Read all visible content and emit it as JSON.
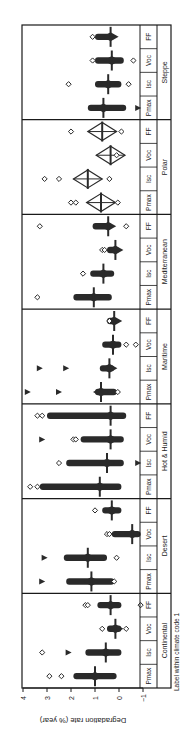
{
  "chart_data": {
    "type": "scatter",
    "subtype": "box-diamond-distribution",
    "orientation": "rotated-90-clockwise",
    "title": "",
    "ylabel": "Degradation rate (% year)",
    "xlabel": "Label within climate code 1",
    "ylim": [
      -1,
      4
    ],
    "yticks": [
      -1,
      0,
      1,
      2,
      3,
      4
    ],
    "grid": false,
    "legend": null,
    "parameters": [
      "Pmax",
      "Isc",
      "Voc",
      "FF"
    ],
    "groups": [
      {
        "name": "Continental",
        "median": {
          "Pmax": 1.0,
          "Isc": 0.55,
          "Voc": 0.15,
          "FF": 0.35
        },
        "range": {
          "Pmax": [
            0.1,
            1.9
          ],
          "Isc": [
            -0.1,
            1.4
          ],
          "Voc": [
            -0.1,
            0.5
          ],
          "FF": [
            -0.1,
            0.9
          ]
        },
        "outliers_open": {
          "Pmax": [
            2.9,
            2.4
          ],
          "Isc": [
            3.2
          ],
          "Voc": [
            0.7,
            -0.3
          ],
          "FF": [
            1.4,
            1.3,
            -0.9
          ]
        },
        "outliers_filled": {
          "Pmax": [],
          "Isc": [
            2.1
          ],
          "Voc": [],
          "FF": []
        }
      },
      {
        "name": "Desert",
        "median": {
          "Pmax": 1.15,
          "Isc": 1.3,
          "Voc": -0.55,
          "FF": 0.3
        },
        "range": {
          "Pmax": [
            0.2,
            2.2
          ],
          "Isc": [
            0.5,
            2.3
          ],
          "Voc": [
            -0.9,
            0.3
          ],
          "FF": [
            -0.1,
            0.7
          ]
        },
        "outliers_open": {
          "Pmax": [
            0.2
          ],
          "Isc": [
            0.1
          ],
          "Voc": [
            0.5,
            0.4
          ],
          "FF": [
            1.0
          ]
        },
        "outliers_filled": {
          "Pmax": [
            3.2
          ],
          "Isc": [
            3.1
          ],
          "Voc": [],
          "FF": []
        }
      },
      {
        "name": "Hot & Humid",
        "median": {
          "Pmax": 0.8,
          "Isc": 0.5,
          "Voc": 0.35,
          "FF": 0.35
        },
        "range": {
          "Pmax": [
            -0.1,
            3.3
          ],
          "Isc": [
            -0.2,
            2.2
          ],
          "Voc": [
            -0.2,
            1.6
          ],
          "FF": [
            -0.3,
            3.0
          ]
        },
        "outliers_open": {
          "Pmax": [
            3.7,
            3.4
          ],
          "Isc": [
            2.5
          ],
          "Voc": [
            1.9,
            1.8
          ],
          "FF": [
            3.4,
            3.2
          ]
        },
        "outliers_filled": {
          "Pmax": [],
          "Isc": [
            -0.8
          ],
          "Voc": [
            3.2
          ],
          "FF": []
        }
      },
      {
        "name": "Maritime",
        "median": {
          "Pmax": 0.75,
          "Isc": 0.4,
          "Voc": 0.25,
          "FF": 0.2
        },
        "range": {
          "Pmax": [
            0.1,
            1.0
          ],
          "Isc": [
            0.2,
            0.8
          ],
          "Voc": [
            -0.1,
            0.7
          ],
          "FF": [
            0.1,
            0.5
          ]
        },
        "outliers_open": {
          "Pmax": [
            0.05
          ],
          "Isc": [],
          "Voc": [
            -0.3,
            -0.7
          ],
          "FF": [
            0.4
          ]
        },
        "outliers_filled": {
          "Pmax": [
            3.8,
            2.5
          ],
          "Isc": [
            3.3,
            2.2
          ],
          "Voc": [],
          "FF": []
        }
      },
      {
        "name": "Mediterranean",
        "median": {
          "Pmax": 1.05,
          "Isc": 0.65,
          "Voc": 0.15,
          "FF": 0.45
        },
        "range": {
          "Pmax": [
            0.3,
            1.9
          ],
          "Isc": [
            0.2,
            1.2
          ],
          "Voc": [
            0.0,
            0.5
          ],
          "FF": [
            0.3,
            1.1
          ]
        },
        "outliers_open": {
          "Pmax": [
            3.4
          ],
          "Isc": [
            1.5
          ],
          "Voc": [
            0.7,
            0.6
          ],
          "FF": [
            3.3,
            -0.3
          ]
        },
        "outliers_filled": {
          "Pmax": [],
          "Isc": [],
          "Voc": [],
          "FF": []
        }
      },
      {
        "name": "Polar",
        "median": {
          "Pmax": 0.75,
          "Isc": 1.3,
          "Voc": 0.35,
          "FF": 0.7
        },
        "range": {
          "Pmax": [
            0.1,
            1.6
          ],
          "Isc": [
            0.5,
            2.1
          ],
          "Voc": [
            0.1,
            0.7
          ],
          "FF": [
            0.1,
            1.3
          ]
        },
        "outliers_open": {
          "Pmax": [
            2.0,
            1.8,
            0.05
          ],
          "Isc": [
            3.1,
            2.5,
            0.4
          ],
          "Voc": [
            0.1
          ],
          "FF": [
            2.0,
            -0.1
          ]
        },
        "outliers_filled": {
          "Pmax": [],
          "Isc": [],
          "Voc": [],
          "FF": []
        }
      },
      {
        "name": "Steppe",
        "median": {
          "Pmax": 0.65,
          "Isc": 0.45,
          "Voc": 0.3,
          "FF": 0.35
        },
        "range": {
          "Pmax": [
            -0.3,
            1.3
          ],
          "Isc": [
            -0.1,
            1.0
          ],
          "Voc": [
            -0.2,
            1.0
          ],
          "FF": [
            0.2,
            1.0
          ]
        },
        "outliers_open": {
          "Pmax": [],
          "Isc": [
            2.1,
            -0.4
          ],
          "Voc": [
            1.1,
            -0.6
          ],
          "FF": [
            1.1
          ]
        },
        "outliers_filled": {
          "Pmax": [
            -0.8
          ],
          "Isc": [],
          "Voc": [],
          "FF": []
        }
      }
    ]
  },
  "axis": {
    "label": "Degradation rate (% year)",
    "ticks": [
      "−1",
      "0",
      "1",
      "2",
      "3",
      "4"
    ],
    "bottom_label": "Label within climate code 1"
  },
  "colors": {
    "marker": "#2a2a2a",
    "frame": "#1a1a1a",
    "background": "#ffffff"
  }
}
